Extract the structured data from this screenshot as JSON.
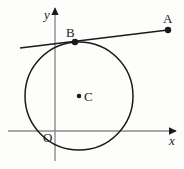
{
  "figure": {
    "kind": "geometry-diagram",
    "background_color": "#fdfdfc",
    "stroke_color": "#1a1a1a",
    "axis_color": "#8a8a8a",
    "width": 184,
    "height": 169
  },
  "axes": {
    "x_axis": {
      "label": "x",
      "y_position": 131,
      "x_start": 8,
      "x_end": 176,
      "arrow": "right"
    },
    "y_axis": {
      "label": "y",
      "x_position": 55,
      "y_start": 161,
      "y_end": 8,
      "arrow": "up"
    },
    "origin": {
      "label": "O",
      "x": 55,
      "y": 131
    }
  },
  "circle": {
    "center": {
      "x": 79,
      "y": 96
    },
    "radius": 54,
    "center_label": "C"
  },
  "points": [
    {
      "label": "A",
      "x": 168,
      "y": 30,
      "dot_radius": 3.2
    },
    {
      "label": "B",
      "x": 75,
      "y": 42,
      "dot_radius": 3.2
    },
    {
      "label": "C",
      "x": 79,
      "y": 96,
      "dot_radius": 2.3
    }
  ],
  "tangent_line": {
    "from": {
      "x": 20,
      "y": 48
    },
    "to": {
      "x": 168,
      "y": 30
    },
    "touches_circle_at": "B"
  },
  "labels": {
    "a_label": "A",
    "b_label": "B",
    "c_label": "C",
    "o_label": "O",
    "x_label": "x",
    "y_label": "y"
  }
}
